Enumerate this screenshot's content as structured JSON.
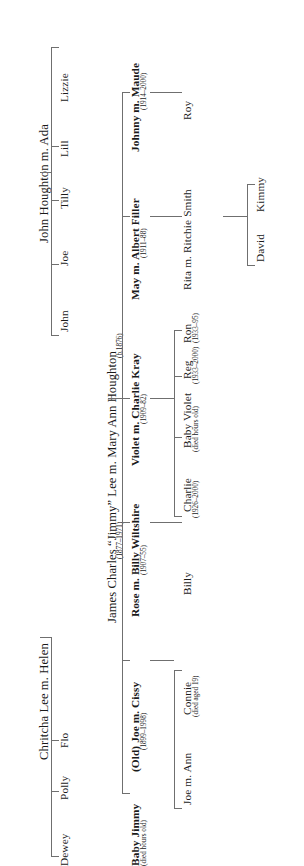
{
  "diagram": {
    "orientation": "rotated-90-ccw",
    "line_color": "#6f6f6f",
    "text_color": "#1a1a1a"
  },
  "generation1": {
    "couple_left": "Chritcha Lee m. Helen",
    "couple_right": "John Houghton m. Ada"
  },
  "generation2": {
    "lee_children": [
      "Dewey",
      "Polly",
      "Flo"
    ],
    "houghton_children": [
      "John",
      "Joe",
      "Tilly",
      "Lill",
      "Lizzie"
    ],
    "union": {
      "name": "James Charles “Jimmy” Lee m. Mary Ann Houghton",
      "dates_left": "(1877–1971)",
      "dates_right": "(b.1876)"
    }
  },
  "generation3": [
    {
      "name": "Baby Jimmy",
      "dates": "(died hours old)",
      "bold": true
    },
    {
      "name": "(Old) Joe m. Cissy",
      "dates": "(1899–1998)",
      "bold": true
    },
    {
      "name": "Rose m. Billy Wiltshire",
      "dates": "(1907–55)",
      "bold": true
    },
    {
      "name": "Violet m. Charlie Kray",
      "dates": "(1909–82)",
      "bold": true
    },
    {
      "name": "May  m. Albert Filler",
      "dates": "(1911–88)",
      "bold": true
    },
    {
      "name": "Johnny m. Maude",
      "dates": "(1914–2000)",
      "bold": true
    }
  ],
  "generation4": {
    "joe_children": [
      {
        "name": "Joe m. Ann",
        "dates": ""
      },
      {
        "name": "Connie",
        "dates": "(died aged 19)"
      }
    ],
    "rose_children": [
      {
        "name": "Billy",
        "dates": ""
      }
    ],
    "violet_children": [
      {
        "name": "Charlie",
        "dates": "(1926–2000)"
      },
      {
        "name": "Baby Violet",
        "dates": "(died hours old)"
      },
      {
        "name": "Reg",
        "dates": "(1933–2000)"
      },
      {
        "name": "Ron",
        "dates": "(1933–95)"
      }
    ],
    "may_children": [
      {
        "name": "Rita m. Ritchie Smith",
        "dates": ""
      }
    ],
    "johnny_children": [
      {
        "name": "Roy",
        "dates": ""
      }
    ]
  },
  "generation5": {
    "rita_children": [
      "David",
      "Kimmy"
    ]
  }
}
